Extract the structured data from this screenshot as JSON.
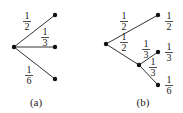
{
  "diagram": {
    "a": {
      "caption": "(a)",
      "root": {
        "x": 14,
        "y": 47
      },
      "leaves": [
        {
          "x": 55,
          "y": 15
        },
        {
          "x": 55,
          "y": 47
        },
        {
          "x": 55,
          "y": 79
        }
      ],
      "edge_labels": [
        {
          "num": "1",
          "den": "2",
          "x": 27,
          "y": 22
        },
        {
          "num": "1",
          "den": "3",
          "x": 45,
          "y": 38
        },
        {
          "num": "1",
          "den": "6",
          "x": 29,
          "y": 76
        }
      ]
    },
    "b": {
      "caption": "(b)",
      "root": {
        "x": 106,
        "y": 44
      },
      "mid": {
        "x": 139,
        "y": 65
      },
      "leaves": [
        {
          "x": 158,
          "y": 15
        },
        {
          "x": 158,
          "y": 52
        },
        {
          "x": 158,
          "y": 85
        }
      ],
      "edge_labels": [
        {
          "num": "1",
          "den": "2",
          "x": 124,
          "y": 22
        },
        {
          "num": "1",
          "den": "2",
          "x": 124,
          "y": 43
        },
        {
          "num": "1",
          "den": "3",
          "x": 146,
          "y": 50
        },
        {
          "num": "1",
          "den": "3",
          "x": 154,
          "y": 68
        }
      ],
      "leaf_labels": [
        {
          "num": "1",
          "den": "2",
          "x": 169,
          "y": 22
        },
        {
          "num": "1",
          "den": "3",
          "x": 169,
          "y": 53
        },
        {
          "num": "1",
          "den": "6",
          "x": 169,
          "y": 86
        }
      ]
    }
  }
}
